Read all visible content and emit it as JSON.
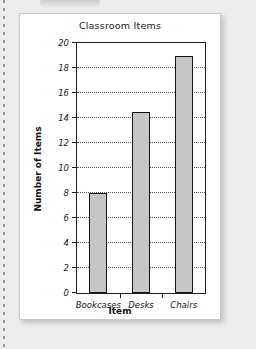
{
  "page": {
    "background_color": "#ededed",
    "paper_color": "#ffffff",
    "notebook_rule": "dotted-margin-line"
  },
  "chart_data": {
    "type": "bar",
    "title": "Classroom Items",
    "xlabel": "Item",
    "ylabel": "Number of Items",
    "categories": [
      "Bookcases",
      "Desks",
      "Chairs"
    ],
    "values": [
      8,
      14.5,
      19
    ],
    "ylim": [
      0,
      20
    ],
    "ytick_step": 2,
    "yticks": [
      0,
      2,
      4,
      6,
      8,
      10,
      12,
      14,
      16,
      18,
      20
    ],
    "ytick_labels": [
      "0",
      "2",
      "4",
      "6",
      "8",
      "10",
      "12",
      "14",
      "16",
      "18",
      "20"
    ],
    "grid": "horizontal-dotted",
    "legend": "none",
    "bar_fill_color": "#c6c6c6",
    "bar_border_color": "#141414",
    "axis_color": "#202020",
    "gridline_color": "#5a5a5a"
  }
}
